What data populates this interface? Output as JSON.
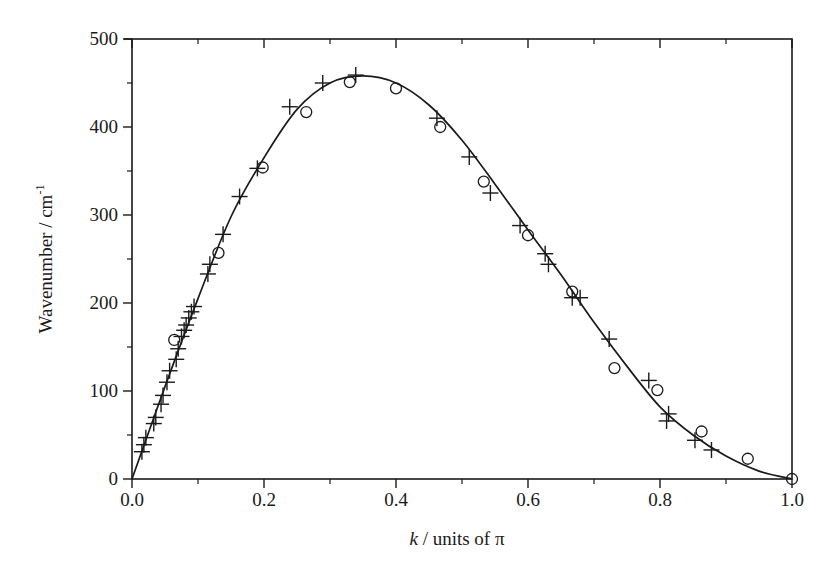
{
  "chart_data": {
    "type": "scatter",
    "title": "",
    "xlabel": "k / units of π",
    "xlabel_parts": {
      "italic": "k",
      "rest": " / units of π"
    },
    "ylabel": "Wavenumber / cm-1",
    "ylabel_parts": {
      "main": "Wavenumber / cm",
      "sup": "-1"
    },
    "xlim": [
      0.0,
      1.0
    ],
    "ylim": [
      0,
      500
    ],
    "x_ticks": [
      "0.0",
      "0.2",
      "0.4",
      "0.6",
      "0.8",
      "1.0"
    ],
    "x_tick_values": [
      0.0,
      0.2,
      0.4,
      0.6,
      0.8,
      1.0
    ],
    "x_minor_tick_values": [
      0.1,
      0.3,
      0.5,
      0.7,
      0.9
    ],
    "y_ticks": [
      "0",
      "100",
      "200",
      "300",
      "400",
      "500"
    ],
    "y_tick_values": [
      0,
      100,
      200,
      300,
      400,
      500
    ],
    "y_minor_tick_values": [
      50,
      150,
      250,
      350,
      450
    ],
    "grid": false,
    "legend": null,
    "series": [
      {
        "name": "crosses",
        "marker": "plus",
        "x": [
          0.015,
          0.018,
          0.021,
          0.033,
          0.036,
          0.044,
          0.047,
          0.053,
          0.057,
          0.067,
          0.07,
          0.075,
          0.079,
          0.082,
          0.086,
          0.09,
          0.094,
          0.115,
          0.118,
          0.138,
          0.163,
          0.19,
          0.239,
          0.289,
          0.339,
          0.462,
          0.511,
          0.543,
          0.588,
          0.626,
          0.631,
          0.667,
          0.679,
          0.723,
          0.783,
          0.813,
          0.81,
          0.853,
          0.878
        ],
        "y": [
          31,
          39,
          47,
          63,
          70,
          85,
          95,
          110,
          123,
          136,
          148,
          162,
          169,
          175,
          183,
          190,
          196,
          233,
          244,
          278,
          321,
          353,
          423,
          450,
          459,
          410,
          366,
          325,
          288,
          256,
          244,
          206,
          206,
          159,
          112,
          74,
          66,
          44,
          33
        ]
      },
      {
        "name": "circles",
        "marker": "circle",
        "x": [
          0.064,
          0.131,
          0.198,
          0.264,
          0.33,
          0.4,
          0.467,
          0.533,
          0.6,
          0.667,
          0.731,
          0.796,
          0.863,
          0.933,
          1.0
        ],
        "y": [
          158,
          257,
          354,
          417,
          451,
          444,
          400,
          338,
          277,
          213,
          126,
          101,
          54,
          23,
          0
        ]
      },
      {
        "name": "fit",
        "marker": "line",
        "x": [
          0.0,
          0.05,
          0.1,
          0.15,
          0.2,
          0.25,
          0.3,
          0.35,
          0.4,
          0.45,
          0.5,
          0.55,
          0.6,
          0.65,
          0.7,
          0.75,
          0.8,
          0.85,
          0.9,
          0.95,
          1.0
        ],
        "y": [
          0,
          105,
          205,
          298,
          365,
          420,
          450,
          458,
          450,
          425,
          385,
          335,
          283,
          232,
          178,
          128,
          82,
          50,
          26,
          9,
          0
        ]
      }
    ]
  },
  "colors": {
    "ink": "#1a1a1a",
    "background": "#ffffff"
  }
}
